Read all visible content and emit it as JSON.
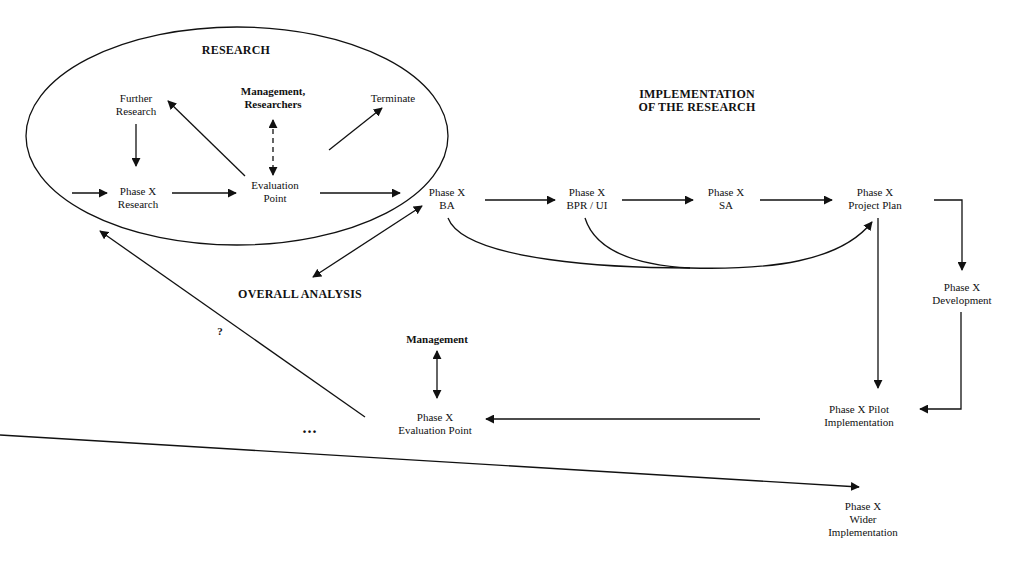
{
  "diagram": {
    "colors": {
      "background": "#ffffff",
      "stroke": "#111111",
      "text": "#111111"
    },
    "groups": {
      "research": {
        "title": "RESEARCH"
      },
      "implementation": {
        "title_line1": "IMPLEMENTATION",
        "title_line2": "OF THE RESEARCH"
      },
      "overall_analysis": {
        "title": "OVERALL ANALYSIS"
      }
    },
    "nodes": {
      "further_research": {
        "line1": "Further",
        "line2": "Research"
      },
      "mgmt_researchers": {
        "line1": "Management,",
        "line2": "Researchers"
      },
      "terminate": {
        "line1": "Terminate"
      },
      "phase_research": {
        "line1": "Phase X",
        "line2": "Research"
      },
      "evaluation_point": {
        "line1": "Evaluation",
        "line2": "Point"
      },
      "phase_ba": {
        "line1": "Phase X",
        "line2": "BA"
      },
      "phase_bpr": {
        "line1": "Phase X",
        "line2": "BPR / UI"
      },
      "phase_sa": {
        "line1": "Phase X",
        "line2": "SA"
      },
      "phase_project_plan": {
        "line1": "Phase X",
        "line2": "Project Plan"
      },
      "phase_development": {
        "line1": "Phase X",
        "line2": "Development"
      },
      "phase_pilot": {
        "line1": "Phase X  Pilot",
        "line2": "Implementation"
      },
      "phase_wider": {
        "line1": "Phase X",
        "line2": "Wider",
        "line3": "Implementation"
      },
      "management": {
        "line1": "Management"
      },
      "phase_eval_point": {
        "line1": "Phase X",
        "line2": "Evaluation Point"
      }
    },
    "annotations": {
      "question": "?",
      "ellipsis": "..."
    },
    "edges": [
      {
        "from": "entry",
        "to": "phase_research"
      },
      {
        "from": "phase_research",
        "to": "evaluation_point"
      },
      {
        "from": "further_research",
        "to": "phase_research"
      },
      {
        "from": "evaluation_point",
        "to": "further_research"
      },
      {
        "from": "evaluation_point",
        "to": "mgmt_researchers",
        "style": "dashed",
        "bidirectional": true
      },
      {
        "from": "evaluation_point",
        "to": "terminate"
      },
      {
        "from": "evaluation_point",
        "to": "phase_ba"
      },
      {
        "from": "phase_ba",
        "to": "overall_analysis",
        "bidirectional": true
      },
      {
        "from": "phase_ba",
        "to": "phase_bpr"
      },
      {
        "from": "phase_bpr",
        "to": "phase_sa"
      },
      {
        "from": "phase_sa",
        "to": "phase_project_plan"
      },
      {
        "from": "phase_ba",
        "to": "phase_project_plan",
        "style": "curve"
      },
      {
        "from": "phase_bpr",
        "to": "phase_project_plan",
        "style": "curve"
      },
      {
        "from": "phase_project_plan",
        "to": "phase_development"
      },
      {
        "from": "phase_project_plan",
        "to": "phase_pilot"
      },
      {
        "from": "phase_development",
        "to": "phase_pilot"
      },
      {
        "from": "phase_pilot",
        "to": "phase_wider"
      },
      {
        "from": "phase_pilot",
        "to": "phase_eval_point"
      },
      {
        "from": "management",
        "to": "phase_eval_point",
        "bidirectional": true
      },
      {
        "from": "phase_eval_point",
        "to": "research",
        "label": "?"
      }
    ]
  }
}
